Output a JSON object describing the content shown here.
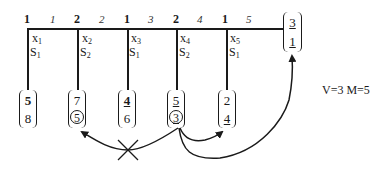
{
  "diagram": {
    "top_row": {
      "group_labels": [
        "1",
        "2",
        "1",
        "2",
        "1"
      ],
      "index_labels": [
        "1",
        "2",
        "3",
        "4",
        "5"
      ]
    },
    "columns": [
      {
        "var": "x",
        "var_sub": "1",
        "set": "S",
        "set_sub": "1",
        "bracket": {
          "top": "5",
          "bottom": "8",
          "top_bold": true,
          "top_underline": false,
          "bottom_underline": false,
          "bottom_circled": false
        }
      },
      {
        "var": "x",
        "var_sub": "2",
        "set": "S",
        "set_sub": "2",
        "bracket": {
          "top": "7",
          "bottom": "5",
          "top_bold": false,
          "top_underline": false,
          "bottom_underline": false,
          "bottom_circled": true
        }
      },
      {
        "var": "x",
        "var_sub": "3",
        "set": "S",
        "set_sub": "1",
        "bracket": {
          "top": "4",
          "bottom": "6",
          "top_bold": true,
          "top_underline": true,
          "bottom_underline": false,
          "bottom_circled": false
        }
      },
      {
        "var": "x",
        "var_sub": "4",
        "set": "S",
        "set_sub": "2",
        "bracket": {
          "top": "5",
          "bottom": "3",
          "top_bold": false,
          "top_underline": true,
          "bottom_underline": true,
          "bottom_circled": true
        }
      },
      {
        "var": "x",
        "var_sub": "5",
        "set": "S",
        "set_sub": "1",
        "bracket": {
          "top": "2",
          "bottom": "4",
          "top_bold": false,
          "top_underline": false,
          "bottom_underline": true,
          "bottom_circled": false
        }
      }
    ],
    "result_bracket": {
      "top": "3",
      "bottom": "1",
      "top_underline": true,
      "bottom_underline": true
    },
    "parameters_label": "V=3 M=5",
    "arrows": [
      {
        "from": "column-4-bottom",
        "to": "column-2-bottom",
        "crossed": true
      },
      {
        "from": "column-4-bottom",
        "to": "column-5-bottom",
        "crossed": false
      },
      {
        "from": "column-4-bottom",
        "to": "result-bracket",
        "crossed": false
      }
    ],
    "colors": {
      "ink": "#1a1a1a",
      "background": "#ffffff"
    }
  }
}
